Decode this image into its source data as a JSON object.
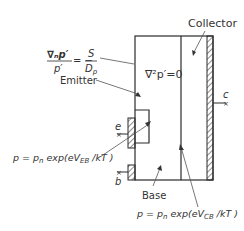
{
  "diagram": {
    "regions": {
      "collector_label": "Collector",
      "emitter_label": "Emitter",
      "base_label": "Base"
    },
    "contacts": {
      "emitter": "e",
      "base": "b",
      "collector": "c"
    },
    "equations": {
      "surface_bc_numerator": "∇ₙp′",
      "surface_bc_denominator": "p′",
      "surface_bc_rhs_prefix": "= −",
      "surface_bc_rhs_num": "S",
      "surface_bc_rhs_den": "D",
      "surface_bc_rhs_den_sub": "p",
      "laplace": "∇²p′=0",
      "emitter_bc_main": "p = p",
      "emitter_bc_sub_n": "n",
      "emitter_bc_exp": " exp(eV",
      "emitter_bc_sub_v": "EB",
      "emitter_bc_tail": " /kT )",
      "collector_bc_main": "p = p",
      "collector_bc_sub_n": "n",
      "collector_bc_exp": " exp(eV",
      "collector_bc_sub_v": "CB",
      "collector_bc_tail": " /kT )"
    },
    "colors": {
      "line": "#2b2b2b",
      "text": "#333333",
      "background": "#ffffff"
    }
  }
}
